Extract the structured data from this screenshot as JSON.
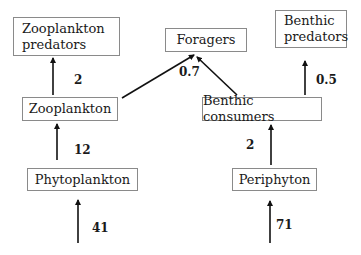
{
  "diagram": {
    "type": "food-web",
    "nodes": {
      "zooplankton_predators": "Zooplankton\npredators",
      "foragers": "Foragers",
      "benthic_predators": "Benthic\npredators",
      "zooplankton": "Zooplankton",
      "benthic_consumers": "Benthic consumers",
      "phytoplankton": "Phytoplankton",
      "periphyton": "Periphyton"
    },
    "edges": [
      {
        "from": "zooplankton",
        "to": "zooplankton_predators",
        "value": "2"
      },
      {
        "from": "zooplankton",
        "to": "foragers",
        "value": "0.7"
      },
      {
        "from": "benthic_consumers",
        "to": "foragers",
        "value": "0.7"
      },
      {
        "from": "benthic_consumers",
        "to": "benthic_predators",
        "value": "0.5"
      },
      {
        "from": "phytoplankton",
        "to": "zooplankton",
        "value": "12"
      },
      {
        "from": "periphyton",
        "to": "benthic_consumers",
        "value": "2"
      },
      {
        "from": "input",
        "to": "phytoplankton",
        "value": "41"
      },
      {
        "from": "input",
        "to": "periphyton",
        "value": "71"
      }
    ],
    "labels": {
      "zoo_to_zoopred": "2",
      "to_foragers": "0.7",
      "benthic_to_bpred": "0.5",
      "phyto_to_zoo": "12",
      "peri_to_benthic": "2",
      "input_phyto": "41",
      "input_peri": "71"
    },
    "colors": {
      "line": "#111111",
      "box_border": "#8a8a8a",
      "text": "#1a1a1a"
    }
  }
}
